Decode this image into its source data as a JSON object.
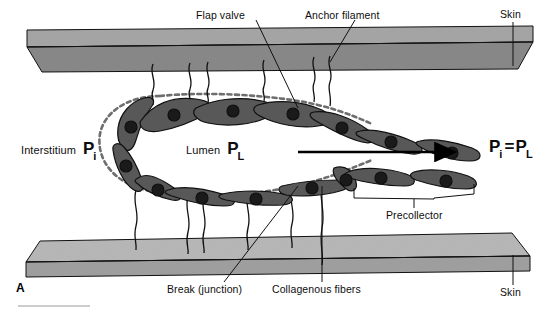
{
  "figure": {
    "panel_letter": "A",
    "width": 549,
    "height": 310,
    "type": "anatomical-diagram"
  },
  "labels": {
    "flap_valve": "Flap valve",
    "anchor_filament": "Anchor filament",
    "skin_top": "Skin",
    "skin_bottom": "Skin",
    "interstitium": "Interstitium",
    "lumen": "Lumen",
    "break_junction": "Break (junction)",
    "collagenous_fibers": "Collagenous fibers",
    "precollector": "Precollector"
  },
  "pressures": {
    "interstitial_symbol": "P",
    "interstitial_subscript": "i",
    "lumen_symbol": "P",
    "lumen_subscript": "L",
    "equality_left_symbol": "P",
    "equality_left_subscript": "i",
    "equality_operator": "=",
    "equality_right_symbol": "P",
    "equality_right_subscript": "L"
  },
  "colors": {
    "cell_fill": "#585858",
    "cell_stroke": "#101010",
    "nucleus_fill": "#1a1a1a",
    "skin_top_face": "#9a9a9a",
    "skin_front_face": "#808080",
    "skin_bottom_top_face": "#b0b0b0",
    "skin_bottom_front_face": "#9a9a9a",
    "outline": "#111111",
    "background": "#ffffff",
    "text": "#0d0d0d",
    "membrane_dash": "#6e6e6e"
  },
  "flow": {
    "arrow_direction": "right",
    "meaning": "lymph flow toward precollector"
  }
}
